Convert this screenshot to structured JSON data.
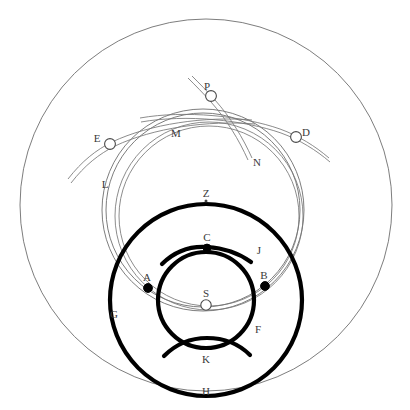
{
  "figure": {
    "background": "#ffffff",
    "stroke_thin": "#6e6e6e",
    "stroke_thick": "#000000",
    "label_color": "#3a3a3a",
    "width": 410,
    "height": 410
  },
  "labels": {
    "P": "P",
    "E": "E",
    "D": "D",
    "M": "M",
    "N": "N",
    "L": "L",
    "Z": "Z",
    "C": "C",
    "J": "J",
    "A": "A",
    "B": "B",
    "S": "S",
    "G": "G",
    "F": "F",
    "K": "K",
    "H": "H"
  },
  "points": [
    {
      "id": "P",
      "label": "P",
      "x": 211,
      "y": 96,
      "kind": "open-node",
      "label_x": 207,
      "label_y": 87
    },
    {
      "id": "E",
      "label": "E",
      "x": 110,
      "y": 144,
      "kind": "open-node",
      "label_x": 99,
      "label_y": 139
    },
    {
      "id": "D",
      "label": "D",
      "x": 296,
      "y": 137,
      "kind": "open-node",
      "label_x": 302,
      "label_y": 132
    },
    {
      "id": "C",
      "label": "C",
      "x": 207,
      "y": 248,
      "kind": "filled-node",
      "label_x": 204,
      "label_y": 240
    },
    {
      "id": "A",
      "label": "A",
      "x": 148,
      "y": 288,
      "kind": "filled-node",
      "label_x": 144,
      "label_y": 280
    },
    {
      "id": "B",
      "label": "B",
      "x": 265,
      "y": 286,
      "kind": "filled-node",
      "label_x": 261,
      "label_y": 277
    },
    {
      "id": "S",
      "label": "S",
      "x": 206,
      "y": 305,
      "kind": "open-node",
      "label_x": 203,
      "label_y": 296
    },
    {
      "id": "Z",
      "label": "Z",
      "x": 206,
      "y": 200,
      "kind": "center-dot",
      "label_x": 203,
      "label_y": 195
    }
  ],
  "text_labels": [
    {
      "id": "M",
      "label": "M",
      "x": 176,
      "y": 134
    },
    {
      "id": "N",
      "label": "N",
      "x": 255,
      "y": 163
    },
    {
      "id": "L",
      "label": "L",
      "x": 105,
      "y": 185
    },
    {
      "id": "J",
      "label": "J",
      "x": 257,
      "y": 251
    },
    {
      "id": "G",
      "label": "G",
      "x": 114,
      "y": 315
    },
    {
      "id": "F",
      "label": "F",
      "x": 256,
      "y": 330
    },
    {
      "id": "K",
      "label": "K",
      "x": 206,
      "y": 360
    },
    {
      "id": "H",
      "label": "H",
      "x": 206,
      "y": 392
    }
  ],
  "circles": {
    "H_outer": {
      "name": "H",
      "cx": 206,
      "cy": 205,
      "r": 186,
      "style": "thin",
      "desc": "outermost boundary circle"
    },
    "L_band_in": {
      "name": "L",
      "cx": 203,
      "cy": 210,
      "r": 97,
      "style": "thin",
      "desc": "L band inner edge"
    },
    "L_band_out": {
      "name": "L",
      "cx": 203,
      "cy": 210,
      "r": 101,
      "style": "thin",
      "desc": "L band outer edge"
    },
    "M_band_in": {
      "name": "M",
      "cx": 209,
      "cy": 216,
      "r": 90,
      "style": "thin",
      "desc": "M band inner edge"
    },
    "M_band_out": {
      "name": "M",
      "cx": 209,
      "cy": 216,
      "r": 94,
      "style": "thin",
      "desc": "M band outer edge"
    },
    "G_thick": {
      "name": "G",
      "cx": 206,
      "cy": 300,
      "r": 96,
      "style": "thick",
      "desc": "thick middle circle"
    },
    "F_thick": {
      "name": "F",
      "cx": 206,
      "cy": 300,
      "r": 48,
      "style": "thick",
      "desc": "thick inner circle"
    }
  },
  "arcs": {
    "N_band": {
      "name": "N",
      "desc": "double-line oblique arc through P descending to N"
    },
    "E_band": {
      "name": "E",
      "desc": "double-line oblique arc tangent at E"
    },
    "D_band": {
      "name": "D",
      "desc": "double-line oblique arc tangent at D"
    },
    "J_arc": {
      "name": "J",
      "desc": "thick arc above F passing through C"
    },
    "K_arc": {
      "name": "K",
      "desc": "thick arc below F, concave upward"
    }
  }
}
